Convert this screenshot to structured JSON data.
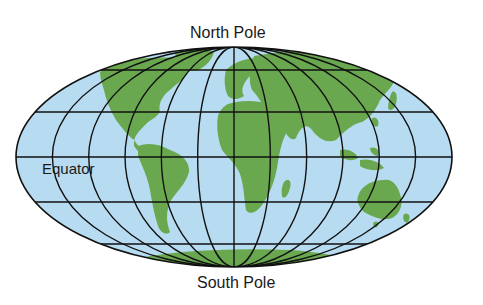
{
  "labels": {
    "north_pole": "North Pole",
    "south_pole": "South Pole",
    "equator": "Equator"
  },
  "colors": {
    "ocean": "#b7dcf1",
    "land": "#6aa84f",
    "grid": "#111111",
    "text": "#1a1a1a",
    "background": "#ffffff"
  },
  "projection": {
    "type": "elliptical (Mollweide-like) world map",
    "center_x": 234,
    "center_y": 157,
    "radius_x": 218,
    "radius_y": 110,
    "meridian_spacing_deg": 30,
    "parallel_offsets_px": [
      -87,
      -45,
      0,
      45,
      87
    ]
  }
}
